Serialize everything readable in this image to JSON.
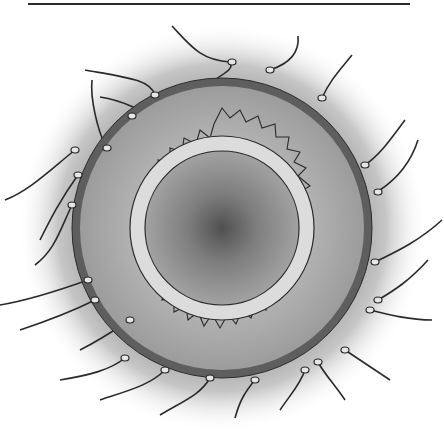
{
  "figure": {
    "title": "",
    "parts": [
      "sperm",
      "corona radiata",
      "zona pellucida",
      "plasma membrane",
      "cytoplasm"
    ],
    "colors": {
      "halo": "#9a9a9a",
      "outer_membrane": "#5e5e5e",
      "corona": "#a8a8a8",
      "zona_ring": "#dcdcdc",
      "cytoplasm": "#8f8f8f",
      "nucleus_shade": "#555555",
      "line": "#2a2a2a"
    }
  }
}
